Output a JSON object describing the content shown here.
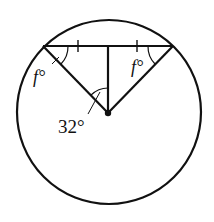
{
  "diagram": {
    "type": "circle-geometry",
    "labels": {
      "left_angle": "f°",
      "right_angle": "f°",
      "center_angle": "32°"
    },
    "elements": {
      "circle": "circle with center O",
      "chord": "horizontal chord near top with two tick marks (equal halves)",
      "radii": "two radii from center to chord endpoints",
      "perpendicular": "vertical segment from center to chord midpoint",
      "center_point": "filled dot at circle center"
    },
    "colors": {
      "stroke": "#111111",
      "background": "#ffffff"
    }
  }
}
